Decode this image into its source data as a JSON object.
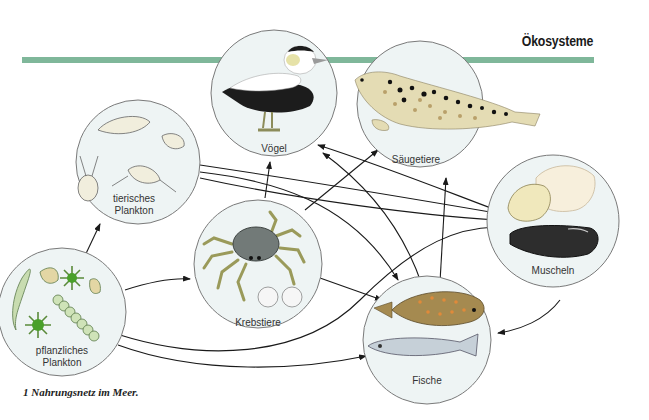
{
  "header": {
    "section_title": "Ökosysteme"
  },
  "caption": "1  Nahrungsnetz im Meer.",
  "colors": {
    "band": "#7fb79a",
    "circle_fill": "#eef4f4",
    "circle_stroke": "#7a7a7a",
    "arrow": "#1a1a1a"
  },
  "nodes": [
    {
      "id": "voegel",
      "label": "Vögel",
      "icon": "eider-duck-icon"
    },
    {
      "id": "saeugetiere",
      "label": "Säugetiere",
      "icon": "seal-icon"
    },
    {
      "id": "tierisches_plankton",
      "label_line1": "tierisches",
      "label_line2": "Plankton",
      "icon": "zooplankton-icon"
    },
    {
      "id": "krebstiere",
      "label": "Krebstiere",
      "icon": "crab-icon"
    },
    {
      "id": "muscheln",
      "label": "Muscheln",
      "icon": "mussel-icon"
    },
    {
      "id": "pflanzliches_plankton",
      "label_line1": "pflanzliches",
      "label_line2": "Plankton",
      "icon": "phytoplankton-icon"
    },
    {
      "id": "fische",
      "label": "Fische",
      "icon": "fish-icon"
    }
  ],
  "edges": [
    {
      "from": "pflanzliches_plankton",
      "to": "tierisches_plankton"
    },
    {
      "from": "pflanzliches_plankton",
      "to": "krebstiere"
    },
    {
      "from": "pflanzliches_plankton",
      "to": "muscheln"
    },
    {
      "from": "pflanzliches_plankton",
      "to": "fische"
    },
    {
      "from": "tierisches_plankton",
      "to": "muscheln"
    },
    {
      "from": "tierisches_plankton",
      "to": "fische"
    },
    {
      "from": "tierisches_plankton",
      "to": "muscheln"
    },
    {
      "from": "krebstiere",
      "to": "voegel"
    },
    {
      "from": "krebstiere",
      "to": "saeugetiere"
    },
    {
      "from": "krebstiere",
      "to": "fische"
    },
    {
      "from": "muscheln",
      "to": "voegel"
    },
    {
      "from": "muscheln",
      "to": "fische"
    },
    {
      "from": "fische",
      "to": "voegel"
    },
    {
      "from": "fische",
      "to": "saeugetiere"
    }
  ]
}
